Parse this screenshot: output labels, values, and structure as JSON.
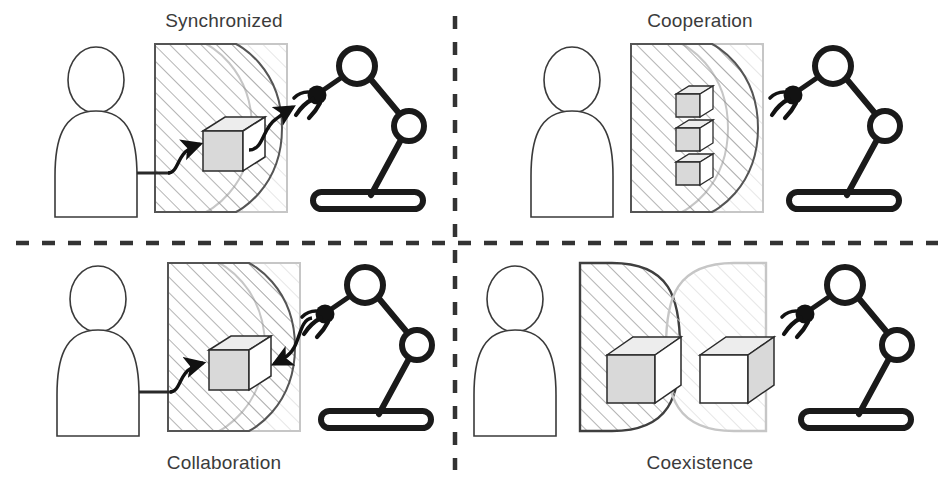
{
  "figure": {
    "type": "diagram",
    "quadrant_count": 4,
    "divider": {
      "style": "dashed",
      "color": "#333333",
      "vertical_x": 455,
      "horizontal_y": 243
    }
  },
  "palette": {
    "human_stroke": "#3a3a3a",
    "human_zone_stroke": "#4a4a4a",
    "human_zone_hatch": "#808080",
    "robot_zone_stroke": "#bdbdbd",
    "robot_zone_hatch": "#d8d8d8",
    "robot_stroke": "#1a1a1a",
    "cube_stroke": "#2b2b2b",
    "cube_shade": "#d9d9d9",
    "arrow_color": "#111111",
    "label_color": "#3b3b3b",
    "background": "#ffffff"
  },
  "quadrants": [
    {
      "id": "synchronized",
      "label": "Synchronized",
      "label_position": "top",
      "workspace_overlap": "partial",
      "object_count": 1,
      "object_location": "overlap-region",
      "arrows": [
        "human-to-object",
        "object-to-robot"
      ],
      "description": "Human hands object to robot; shared workspace, sequential actions"
    },
    {
      "id": "cooperation",
      "label": "Cooperation",
      "label_position": "top",
      "workspace_overlap": "partial",
      "object_count": 3,
      "object_location": "human-zone",
      "arrows": [],
      "description": "Shared workspace, no direct object exchange"
    },
    {
      "id": "collaboration",
      "label": "Collaboration",
      "label_position": "bottom",
      "workspace_overlap": "partial",
      "object_count": 1,
      "object_location": "overlap-region",
      "arrows": [
        "human-to-object",
        "robot-to-object"
      ],
      "description": "Human and robot act on the same object simultaneously"
    },
    {
      "id": "coexistence",
      "label": "Coexistence",
      "label_position": "bottom",
      "workspace_overlap": "none",
      "object_count": 2,
      "object_location": "separate-zones",
      "arrows": [],
      "description": "Separate workspaces, separate objects, no interaction"
    }
  ],
  "actors": {
    "human": {
      "name": "human-figure",
      "icon": "person-icon",
      "rendering": "outline"
    },
    "robot": {
      "name": "robot-arm",
      "icon": "robot-arm-icon",
      "rendering": "thick-outline",
      "parts": [
        "base",
        "lower-link",
        "elbow-joint",
        "upper-link",
        "shoulder-joint",
        "wrist-link",
        "gripper"
      ]
    },
    "object": {
      "name": "work-object",
      "icon": "cube-icon",
      "rendering": "isometric-box"
    }
  },
  "zones": {
    "human_zone": {
      "name": "human-workspace",
      "fill": "diagonal-hatch",
      "shape": "D-shape-right-bulge"
    },
    "robot_zone": {
      "name": "robot-workspace",
      "fill": "light-diagonal-hatch",
      "shape": "D-shape-left-bulge"
    }
  }
}
